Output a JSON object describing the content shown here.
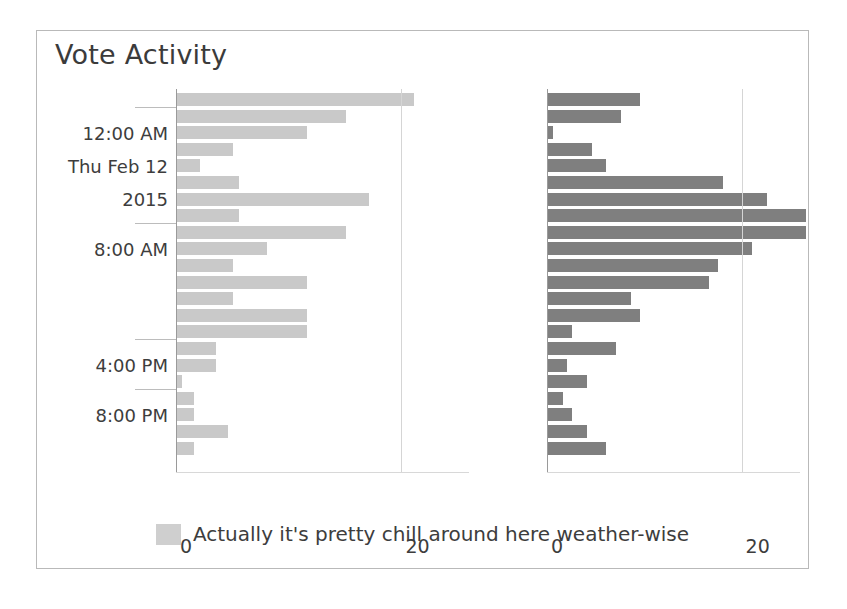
{
  "title": "Vote Activity",
  "legend": {
    "swatch_color": "#cfcfcf",
    "label": "Actually it's pretty chill around here weather-wise"
  },
  "colors": {
    "bar_left": "#c9c9c9",
    "bar_right": "#7f7f7f",
    "axis": "#9a9a9a",
    "grid": "#d5d5d5",
    "text": "#3d3d3d",
    "frame_border": "#b9b9b9",
    "background": "#ffffff"
  },
  "y_axis": {
    "ticks": [
      {
        "label": "12:00 AM",
        "row": 2
      },
      {
        "label": "Thu Feb 12",
        "row": 4
      },
      {
        "label": "2015",
        "row": 6
      },
      {
        "label": "8:00 AM",
        "row": 9
      },
      {
        "label": "4:00 PM",
        "row": 16
      },
      {
        "label": "8:00 PM",
        "row": 19
      }
    ],
    "tick_rows": [
      1,
      8,
      15,
      18
    ]
  },
  "x_axis": {
    "ticks": [
      0,
      20
    ],
    "tick_labels": [
      "0",
      "20"
    ],
    "xlim": [
      0,
      26
    ]
  },
  "chart_data": {
    "type": "bar",
    "title": "Vote Activity",
    "xlabel": "",
    "ylabel": "",
    "orientation": "horizontal",
    "grid": true,
    "legend_position": "bottom",
    "xlim": [
      0,
      26
    ],
    "xticks": [
      0,
      20
    ],
    "panels": [
      {
        "name": "left-panel",
        "color": "#c9c9c9",
        "categories": [
          "r0",
          "r1",
          "r2",
          "r3",
          "r4",
          "r5",
          "r6",
          "r7",
          "r8",
          "r9",
          "r10",
          "r11",
          "r12",
          "r13",
          "r14",
          "r15",
          "r16",
          "r17",
          "r18",
          "r19",
          "r20",
          "r21"
        ],
        "values": [
          21,
          15,
          11.5,
          5,
          2,
          5.5,
          17,
          5.5,
          15,
          8,
          5,
          11.5,
          5,
          11.5,
          11.5,
          3.5,
          3.5,
          0.4,
          1.5,
          1.5,
          4.5,
          1.5
        ]
      },
      {
        "name": "right-panel",
        "color": "#7f7f7f",
        "categories": [
          "r0",
          "r1",
          "r2",
          "r3",
          "r4",
          "r5",
          "r6",
          "r7",
          "r8",
          "r9",
          "r10",
          "r11",
          "r12",
          "r13",
          "r14",
          "r15",
          "r16",
          "r17",
          "r18",
          "r19",
          "r20",
          "r21"
        ],
        "values": [
          9.5,
          7.5,
          0.5,
          4.5,
          6,
          18,
          22.5,
          26.5,
          26.5,
          21,
          17.5,
          16.5,
          8.5,
          9.5,
          2.5,
          7,
          2,
          4,
          1.5,
          2.5,
          4,
          6
        ]
      }
    ],
    "y_tick_labels": [
      "12:00 AM",
      "Thu Feb 12",
      "2015",
      "8:00 AM",
      "4:00 PM",
      "8:00 PM"
    ],
    "series_label": "Actually it's pretty chill around here weather-wise"
  }
}
